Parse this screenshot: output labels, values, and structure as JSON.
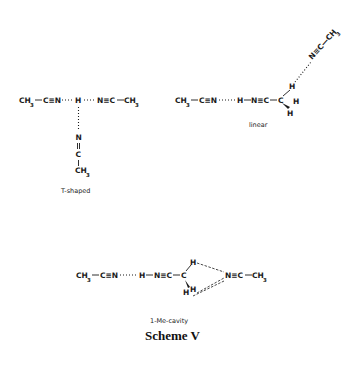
{
  "scheme": {
    "title": "Scheme V",
    "structures": [
      {
        "id": "t-shaped",
        "caption": "T-shaped",
        "atoms": {
          "left_ch": "CH",
          "left_3": "3",
          "left_cn": "C≡N",
          "center_h": "H",
          "right_nc": "N≡C",
          "right_ch": "CH",
          "right_3": "3",
          "down_n": "N",
          "down_eq": "=",
          "down_c": "C",
          "down_ch": "CH",
          "down_3": "3"
        }
      },
      {
        "id": "linear",
        "caption": "linear",
        "atoms": {
          "left_ch": "CH",
          "left_3": "3",
          "left_cn": "C≡N",
          "h": "H",
          "nc": "N≡C",
          "c": "C",
          "h_up": "H",
          "h_right": "H",
          "h_down": "H",
          "upper_label": "N≡C—CH",
          "upper_3": "3"
        }
      },
      {
        "id": "1-me-cavity",
        "caption": "1-Me-cavity",
        "atoms": {
          "left_ch": "CH",
          "left_3": "3",
          "left_cn": "C≡N",
          "h": "H",
          "nc": "N≡C",
          "c": "C",
          "h_up": "H",
          "h_down1": "H",
          "h_down2": "H",
          "right_nc": "N≡C",
          "right_ch": "CH",
          "right_3": "3"
        }
      }
    ]
  }
}
